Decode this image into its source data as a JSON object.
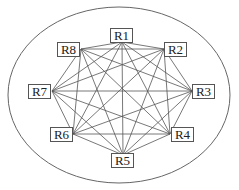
{
  "diagram": {
    "type": "complete-graph",
    "boundary": {
      "shape": "ellipse",
      "cx": 119,
      "cy": 95,
      "rx": 111,
      "ry": 88
    },
    "nodes": [
      {
        "id": "R1",
        "label": "R1",
        "box": [
          110,
          28
        ],
        "anchor": [
          122,
          42
        ]
      },
      {
        "id": "R2",
        "label": "R2",
        "box": [
          164,
          42
        ],
        "anchor": [
          164,
          49
        ]
      },
      {
        "id": "R3",
        "label": "R3",
        "box": [
          192,
          84
        ],
        "anchor": [
          192,
          91
        ]
      },
      {
        "id": "R4",
        "label": "R4",
        "box": [
          171,
          127
        ],
        "anchor": [
          170,
          134
        ]
      },
      {
        "id": "R5",
        "label": "R5",
        "box": [
          111,
          153
        ],
        "anchor": [
          123,
          155
        ]
      },
      {
        "id": "R6",
        "label": "R6",
        "box": [
          50,
          127
        ],
        "anchor": [
          73,
          134
        ]
      },
      {
        "id": "R7",
        "label": "R7",
        "box": [
          28,
          84
        ],
        "anchor": [
          52,
          91
        ]
      },
      {
        "id": "R8",
        "label": "R8",
        "box": [
          57,
          42
        ],
        "anchor": [
          81,
          49
        ]
      }
    ],
    "edges": "all-pairs"
  }
}
